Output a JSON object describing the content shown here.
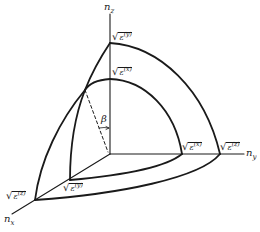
{
  "diagram": {
    "type": "index-ellipsoid-octant",
    "colors": {
      "line": "#1a1a1a",
      "background": "#ffffff"
    },
    "axes": {
      "z": {
        "label": "n",
        "sub": "z"
      },
      "y": {
        "label": "n",
        "sub": "y"
      },
      "x": {
        "label": "n",
        "sub": "x"
      }
    },
    "labels": {
      "outer_z": {
        "radical": "√",
        "base": "ε",
        "sup": "(y)"
      },
      "inner_z": {
        "radical": "√",
        "base": "ε",
        "sup": "(x)"
      },
      "inner_y": {
        "radical": "√",
        "base": "ε",
        "sup": "(x)"
      },
      "outer_y": {
        "radical": "√",
        "base": "ε",
        "sup": "(z)"
      },
      "outer_x": {
        "radical": "√",
        "base": "ε",
        "sup": "(z)"
      },
      "inner_x": {
        "radical": "√",
        "base": "ε",
        "sup": "(y)"
      },
      "angle": "β"
    }
  }
}
